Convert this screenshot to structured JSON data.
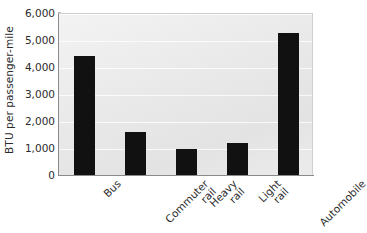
{
  "chart_data": {
    "type": "bar",
    "title": "",
    "subtitle": "",
    "xlabel": "",
    "ylabel": "BTU per passenger-mile",
    "categories": [
      "Bus",
      "Commuter rail",
      "Heavy rail",
      "Light rail",
      "Automobile"
    ],
    "values": [
      4400,
      1600,
      950,
      1200,
      5250
    ],
    "ylim": [
      0,
      6000
    ],
    "ytick_values": [
      0,
      1000,
      2000,
      3000,
      4000,
      5000,
      6000
    ],
    "ytick_labels": [
      "0",
      "1,000",
      "2,000",
      "3,000",
      "4,000",
      "5,000",
      "6,000"
    ],
    "grid": true,
    "legend": false,
    "legend_position": "none",
    "bar_color": "#111111",
    "plot_background": "#e9e9e9",
    "axis_color": "#8a8a8a",
    "text_color": "#2b2b2b"
  },
  "axes": {
    "y_title": "BTU per passenger-mile",
    "ticks": [
      {
        "label": "6,000",
        "value": 6000
      },
      {
        "label": "5,000",
        "value": 5000
      },
      {
        "label": "4,000",
        "value": 4000
      },
      {
        "label": "3,000",
        "value": 3000
      },
      {
        "label": "2,000",
        "value": 2000
      },
      {
        "label": "1,000",
        "value": 1000
      },
      {
        "label": "0",
        "value": 0
      }
    ]
  },
  "bars": [
    {
      "category": "Bus",
      "line1": "Bus",
      "line2": "",
      "value": 4400
    },
    {
      "category": "Commuter rail",
      "line1": "Commuter",
      "line2": "rail",
      "value": 1600
    },
    {
      "category": "Heavy rail",
      "line1": "Heavy",
      "line2": "rail",
      "value": 950
    },
    {
      "category": "Light rail",
      "line1": "Light",
      "line2": "rail",
      "value": 1200
    },
    {
      "category": "Automobile",
      "line1": "Automobile",
      "line2": "",
      "value": 5250
    }
  ]
}
